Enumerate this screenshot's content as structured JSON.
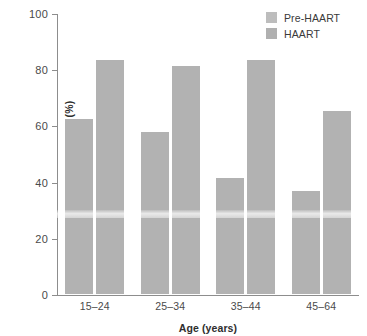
{
  "chart_data": {
    "type": "bar",
    "title": "",
    "subtitle": "",
    "xlabel": "Age (years)",
    "ylabel": "10-Year Survival Rates (%)",
    "categories": [
      "15–24",
      "25–34",
      "35–44",
      "45–64"
    ],
    "series": [
      {
        "name": "Pre-HAART",
        "values": [
          63,
          58.5,
          42,
          37.5
        ],
        "color": "#b2b2b2"
      },
      {
        "name": "HAART",
        "values": [
          84,
          82,
          84,
          66
        ],
        "color": "#b2b2b2"
      }
    ],
    "ylim": [
      0,
      100
    ],
    "yticks": [
      0,
      20,
      40,
      60,
      80,
      100
    ],
    "ytick_labels": [
      "0",
      "20",
      "40",
      "60",
      "80",
      "100"
    ],
    "grid": false,
    "legend_position": "top-right",
    "annotations": []
  },
  "legend": {
    "items": [
      {
        "label": "Pre-HAART",
        "color": "#bdbdbd"
      },
      {
        "label": "HAART",
        "color": "#b0b0b0"
      }
    ]
  },
  "axes": {
    "y_title": "10-Year Survival Rates (%)",
    "x_title": "Age (years)"
  }
}
